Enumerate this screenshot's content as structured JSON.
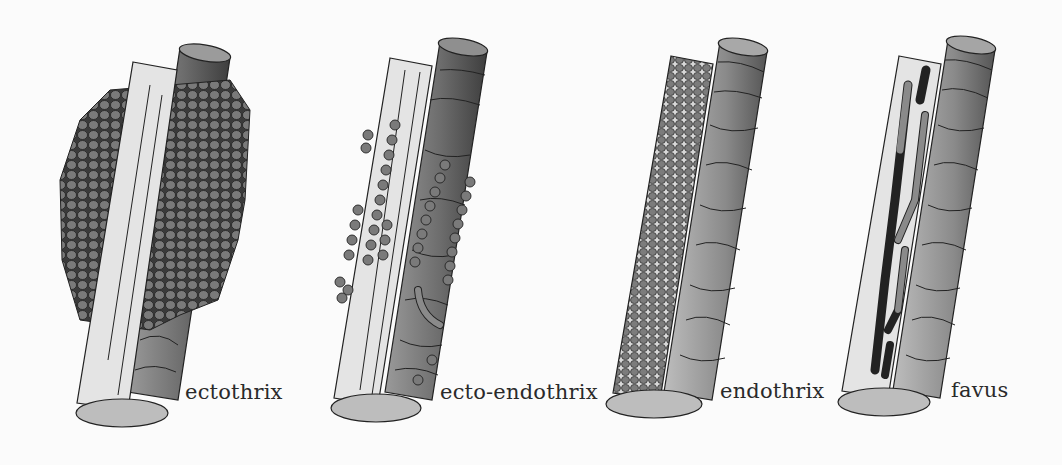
{
  "figure": {
    "panels": [
      {
        "id": "ectothrix",
        "label": "ectothrix"
      },
      {
        "id": "ecto-endothrix",
        "label": "ecto-endothrix"
      },
      {
        "id": "endothrix",
        "label": "endothrix"
      },
      {
        "id": "favus",
        "label": "favus"
      }
    ]
  },
  "colors": {
    "background": "#fbfbfb",
    "outline": "#222222",
    "hair_shaft_light": "#e6e6e6",
    "cuticle_dark": "#4a4a4a",
    "spore_fill": "#777777",
    "hyphae_dark": "#1e1e1e",
    "hyphae_mid": "#8a8a8a"
  }
}
